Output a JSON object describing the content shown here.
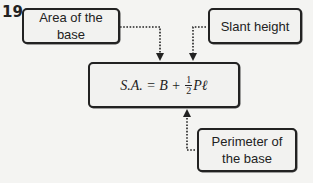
{
  "problem_number": "19.",
  "labels": {
    "area_of_base": "Area of the base",
    "slant_height": "Slant height",
    "perimeter_line1": "Perimeter of",
    "perimeter_line2": "the base"
  },
  "formula": {
    "lhs": "S.A. = B + ",
    "frac_num": "1",
    "frac_den": "2",
    "tail": "Pℓ"
  }
}
